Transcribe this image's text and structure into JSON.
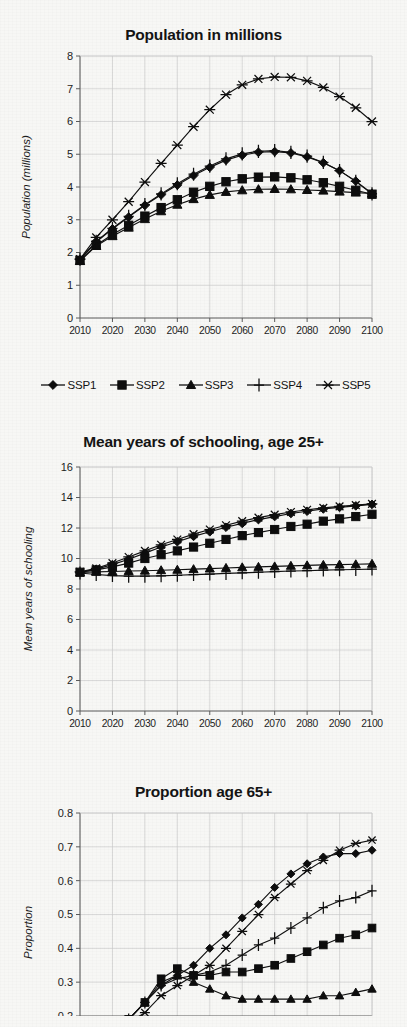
{
  "figure": {
    "background": "#f7f7f5",
    "ink": "#101010",
    "grid_color": "#c9c9c9",
    "axis_color": "#5b5b5b"
  },
  "legend": {
    "name": "ssp-legend",
    "position": "below-first-chart",
    "items": [
      {
        "label": "SSP1",
        "marker": "diamond"
      },
      {
        "label": "SSP2",
        "marker": "square"
      },
      {
        "label": "SSP3",
        "marker": "triangle"
      },
      {
        "label": "SSP4",
        "marker": "plus"
      },
      {
        "label": "SSP5",
        "marker": "asterisk"
      }
    ]
  },
  "chart_data": [
    {
      "id": "population",
      "type": "line",
      "title": "Population in millions",
      "xlabel": "",
      "ylabel": "Population (millions)",
      "x": [
        2010,
        2015,
        2020,
        2025,
        2030,
        2035,
        2040,
        2045,
        2050,
        2055,
        2060,
        2065,
        2070,
        2075,
        2080,
        2085,
        2090,
        2095,
        2100
      ],
      "xticks": [
        2010,
        2020,
        2030,
        2040,
        2050,
        2060,
        2070,
        2080,
        2090,
        2100
      ],
      "xlim": [
        2010,
        2100
      ],
      "ylim": [
        0,
        8
      ],
      "yticks": [
        0,
        1,
        2,
        3,
        4,
        5,
        6,
        7,
        8
      ],
      "grid": true,
      "legend_position": "below",
      "series": [
        {
          "name": "SSP1",
          "marker": "diamond",
          "values": [
            1.78,
            2.32,
            2.72,
            3.08,
            3.44,
            3.76,
            4.06,
            4.35,
            4.6,
            4.82,
            4.97,
            5.06,
            5.08,
            5.04,
            4.92,
            4.74,
            4.5,
            4.18,
            3.8
          ]
        },
        {
          "name": "SSP2",
          "marker": "square",
          "values": [
            1.76,
            2.22,
            2.55,
            2.83,
            3.11,
            3.37,
            3.61,
            3.84,
            4.02,
            4.16,
            4.25,
            4.3,
            4.31,
            4.28,
            4.22,
            4.13,
            4.02,
            3.9,
            3.78
          ]
        },
        {
          "name": "SSP3",
          "marker": "triangle",
          "values": [
            1.74,
            2.2,
            2.5,
            2.76,
            3.02,
            3.26,
            3.46,
            3.63,
            3.76,
            3.85,
            3.9,
            3.93,
            3.94,
            3.93,
            3.91,
            3.89,
            3.86,
            3.83,
            3.8
          ]
        },
        {
          "name": "SSP4",
          "marker": "plus",
          "values": [
            1.8,
            2.34,
            2.74,
            3.1,
            3.46,
            3.79,
            4.1,
            4.39,
            4.64,
            4.86,
            5.01,
            5.09,
            5.11,
            5.06,
            4.94,
            4.75,
            4.5,
            4.17,
            3.79
          ]
        },
        {
          "name": "SSP5",
          "marker": "asterisk",
          "values": [
            1.8,
            2.46,
            3.0,
            3.55,
            4.15,
            4.72,
            5.28,
            5.84,
            6.36,
            6.82,
            7.12,
            7.3,
            7.36,
            7.35,
            7.24,
            7.04,
            6.76,
            6.42,
            6.0
          ]
        }
      ]
    },
    {
      "id": "schooling",
      "type": "line",
      "title": "Mean years of schooling, age 25+",
      "xlabel": "",
      "ylabel": "Mean years of schooling",
      "x": [
        2010,
        2015,
        2020,
        2025,
        2030,
        2035,
        2040,
        2045,
        2050,
        2055,
        2060,
        2065,
        2070,
        2075,
        2080,
        2085,
        2090,
        2095,
        2100
      ],
      "xticks": [
        2010,
        2020,
        2030,
        2040,
        2050,
        2060,
        2070,
        2080,
        2090,
        2100
      ],
      "xlim": [
        2010,
        2100
      ],
      "ylim": [
        0,
        16
      ],
      "yticks": [
        0,
        2,
        4,
        6,
        8,
        10,
        12,
        14,
        16
      ],
      "grid": true,
      "legend_position": "shared-above",
      "series": [
        {
          "name": "SSP1",
          "marker": "diamond",
          "values": [
            9.1,
            9.3,
            9.6,
            9.95,
            10.35,
            10.75,
            11.1,
            11.45,
            11.75,
            12.05,
            12.3,
            12.55,
            12.75,
            12.95,
            13.1,
            13.25,
            13.35,
            13.45,
            13.55
          ]
        },
        {
          "name": "SSP2",
          "marker": "square",
          "values": [
            9.1,
            9.25,
            9.45,
            9.7,
            10.0,
            10.25,
            10.5,
            10.75,
            11.0,
            11.25,
            11.5,
            11.7,
            11.9,
            12.1,
            12.25,
            12.45,
            12.6,
            12.75,
            12.9
          ]
        },
        {
          "name": "SSP3",
          "marker": "triangle",
          "values": [
            9.08,
            9.12,
            9.15,
            9.18,
            9.2,
            9.23,
            9.26,
            9.3,
            9.34,
            9.38,
            9.42,
            9.45,
            9.48,
            9.52,
            9.55,
            9.58,
            9.6,
            9.62,
            9.65
          ]
        },
        {
          "name": "SSP4",
          "marker": "plus",
          "values": [
            9.05,
            8.95,
            8.88,
            8.84,
            8.84,
            8.86,
            8.9,
            8.94,
            8.98,
            9.02,
            9.06,
            9.1,
            9.14,
            9.18,
            9.2,
            9.24,
            9.26,
            9.28,
            9.3
          ]
        },
        {
          "name": "SSP5",
          "marker": "asterisk",
          "values": [
            9.12,
            9.35,
            9.7,
            10.1,
            10.5,
            10.9,
            11.25,
            11.6,
            11.9,
            12.18,
            12.45,
            12.68,
            12.88,
            13.05,
            13.2,
            13.32,
            13.42,
            13.5,
            13.58
          ]
        }
      ]
    },
    {
      "id": "proportion",
      "type": "line",
      "title": "Proportion age 65+",
      "xlabel": "",
      "ylabel": "Proportion",
      "x": [
        2010,
        2015,
        2020,
        2025,
        2030,
        2035,
        2040,
        2045,
        2050,
        2055,
        2060,
        2065,
        2070,
        2075,
        2080,
        2085,
        2090,
        2095,
        2100
      ],
      "xticks": [
        2010,
        2020,
        2030,
        2040,
        2050,
        2060,
        2070,
        2080,
        2090,
        2100
      ],
      "xlim": [
        2010,
        2100
      ],
      "ylim": [
        0.2,
        0.8
      ],
      "yticks": [
        0.2,
        0.3,
        0.4,
        0.5,
        0.6,
        0.7,
        0.8
      ],
      "ytick_labels": [
        "0.2",
        "0.3",
        "0.4",
        "0.5",
        "0.6",
        "0.7",
        "0.8"
      ],
      "grid": true,
      "legend_position": "shared-above",
      "series": [
        {
          "name": "SSP1",
          "marker": "diamond",
          "values": [
            0.1,
            0.13,
            0.16,
            0.19,
            0.24,
            0.29,
            0.32,
            0.35,
            0.4,
            0.44,
            0.49,
            0.53,
            0.58,
            0.62,
            0.65,
            0.67,
            0.68,
            0.68,
            0.69
          ]
        },
        {
          "name": "SSP2",
          "marker": "square",
          "values": [
            0.1,
            0.13,
            0.16,
            0.19,
            0.24,
            0.31,
            0.34,
            0.32,
            0.32,
            0.33,
            0.33,
            0.34,
            0.35,
            0.37,
            0.39,
            0.41,
            0.43,
            0.44,
            0.46
          ]
        },
        {
          "name": "SSP3",
          "marker": "triangle",
          "values": [
            0.1,
            0.13,
            0.16,
            0.19,
            0.24,
            0.3,
            0.32,
            0.3,
            0.28,
            0.26,
            0.25,
            0.25,
            0.25,
            0.25,
            0.25,
            0.26,
            0.26,
            0.27,
            0.28
          ]
        },
        {
          "name": "SSP4",
          "marker": "plus",
          "values": [
            0.1,
            0.13,
            0.16,
            0.19,
            0.24,
            0.29,
            0.31,
            0.32,
            0.33,
            0.35,
            0.38,
            0.41,
            0.43,
            0.46,
            0.49,
            0.52,
            0.54,
            0.55,
            0.57
          ]
        },
        {
          "name": "SSP5",
          "marker": "asterisk",
          "values": [
            0.09,
            0.12,
            0.15,
            0.18,
            0.21,
            0.26,
            0.29,
            0.32,
            0.35,
            0.4,
            0.45,
            0.5,
            0.55,
            0.59,
            0.63,
            0.66,
            0.69,
            0.71,
            0.72
          ]
        }
      ]
    }
  ]
}
